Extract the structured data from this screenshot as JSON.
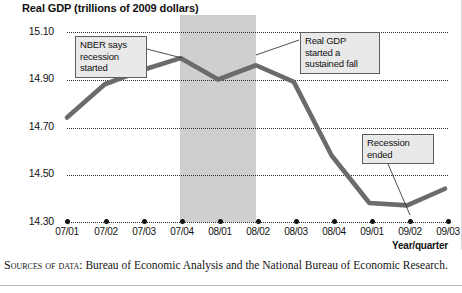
{
  "chart_data": {
    "type": "line",
    "title": "Real GDP (trillions of 2009 dollars)",
    "xlabel": "Year/quarter",
    "ylabel": "Real GDP (trillions of 2009 dollars)",
    "categories": [
      "07/01",
      "07/02",
      "07/03",
      "07/04",
      "08/01",
      "08/02",
      "08/03",
      "08/04",
      "09/01",
      "09/02",
      "09/03"
    ],
    "values": [
      14.74,
      14.88,
      14.94,
      14.99,
      14.9,
      14.96,
      14.89,
      14.58,
      14.38,
      14.37,
      14.44
    ],
    "series": [
      {
        "name": "Real GDP",
        "values": [
          14.74,
          14.88,
          14.94,
          14.99,
          14.9,
          14.96,
          14.89,
          14.58,
          14.38,
          14.37,
          14.44
        ]
      }
    ],
    "ylim": [
      14.3,
      15.1
    ],
    "yticks": [
      "15.10",
      "14.90",
      "14.70",
      "14.50",
      "14.30"
    ],
    "ytick_values": [
      15.1,
      14.9,
      14.7,
      14.5,
      14.3
    ],
    "grid": "horizontal-dotted",
    "legend": "none",
    "shaded_region": {
      "label": "recession",
      "from": "07/04",
      "to": "08/02",
      "color": "#cfcfcf"
    },
    "line_color": "#6b6b6b",
    "annotations": [
      {
        "id": "nber",
        "text": "NBER says\nrecession\nstarted",
        "points_to": "07/04"
      },
      {
        "id": "fall",
        "text": "Real GDP\nstarted a\nsustained fall",
        "points_to": "08/02"
      },
      {
        "id": "ended",
        "text": "Recession\nended",
        "points_to": "09/02"
      }
    ]
  },
  "chart": {
    "title": "Real GDP (trillions of 2009 dollars)",
    "x_axis_label": "Year/quarter",
    "y_ticks": [
      "15.10",
      "14.90",
      "14.70",
      "14.50",
      "14.30"
    ],
    "x_ticks": [
      "07/01",
      "07/02",
      "07/03",
      "07/04",
      "08/01",
      "08/02",
      "08/03",
      "08/04",
      "09/01",
      "09/02",
      "09/03"
    ],
    "callouts": {
      "nber": "NBER says\nrecession\nstarted",
      "sustained_fall": "Real GDP\nstarted a\nsustained fall",
      "recession_ended": "Recession\nended"
    }
  },
  "source_note": {
    "label": "Sources of data:",
    "text": " Bureau of Economic Analysis and the National Bureau of Economic Research."
  },
  "colors": {
    "line": "#6b6b6b",
    "band": "#cfcfcf",
    "grid": "#2b2b2b",
    "callout_bg": "#e9e9e9",
    "callout_border": "#5d5d5d"
  }
}
